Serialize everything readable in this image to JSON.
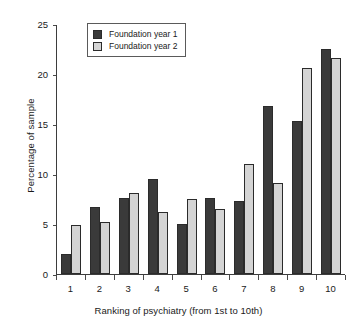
{
  "chart_data": {
    "type": "bar",
    "title": "",
    "xlabel": "Ranking of psychiatry (from 1st to 10th)",
    "ylabel": "Percentage of sample",
    "categories": [
      "1",
      "2",
      "3",
      "4",
      "5",
      "6",
      "7",
      "8",
      "9",
      "10"
    ],
    "series": [
      {
        "name": "Foundation year 1",
        "color": "#3a3a3a",
        "values": [
          2.0,
          6.7,
          7.6,
          9.5,
          5.0,
          7.6,
          7.3,
          16.8,
          15.3,
          22.5
        ]
      },
      {
        "name": "Foundation year 2",
        "color": "#d4d4d4",
        "values": [
          4.9,
          5.2,
          8.1,
          6.2,
          7.5,
          6.5,
          11.0,
          9.1,
          20.6,
          21.6
        ]
      }
    ],
    "ylim": [
      0,
      25
    ],
    "yticks": [
      0,
      5,
      10,
      15,
      20,
      25
    ],
    "ytick_labels": [
      "0",
      "5",
      "10",
      "15",
      "20",
      "25"
    ],
    "grid": false,
    "legend_position": "top-left-inside"
  },
  "legend": {
    "items": [
      {
        "label": "Foundation year 1"
      },
      {
        "label": "Foundation year 2"
      }
    ]
  }
}
